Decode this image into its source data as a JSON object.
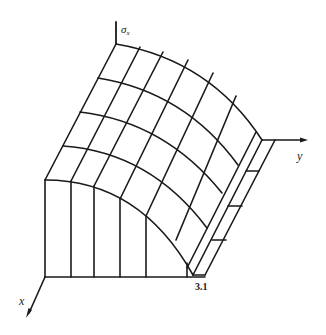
{
  "figure": {
    "type": "3d-surface-wireframe",
    "axes": {
      "vertical": {
        "label": "σ",
        "subscript": "x"
      },
      "right": {
        "label": "y"
      },
      "left": {
        "label": "x"
      }
    },
    "annotations": [
      {
        "text": "3.1",
        "position": "base-right-corner"
      }
    ],
    "colors": {
      "line": "#1a1a1a",
      "background": "#ffffff"
    },
    "mesh": {
      "rows": 4,
      "columns": 5,
      "front_verticals": 6,
      "edge_strip_bands": 3
    }
  }
}
